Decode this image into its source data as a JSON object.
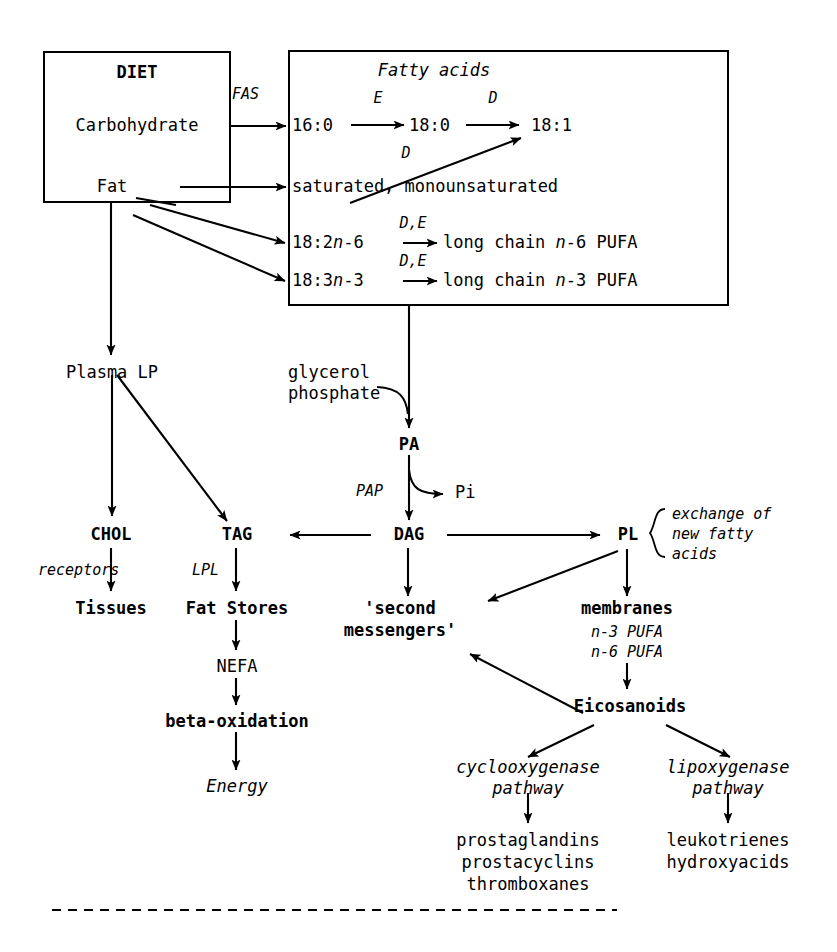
{
  "diagram": {
    "ink_color": "#000000",
    "background_color": "#ffffff",
    "boxes": {
      "diet": {
        "heading": "DIET",
        "items": [
          "Carbohydrate",
          "Fat"
        ]
      },
      "fatty_acids": {
        "heading": "Fatty acids",
        "chain": {
          "a": "16:0",
          "b": "18:0",
          "c": "18:1"
        },
        "saturated_row": "saturated, monounsaturated",
        "n6_precursor": "18:2n-6",
        "n6_product": "long chain n-6 PUFA",
        "n3_precursor": "18:3n-3",
        "n3_product": "long chain n-3 PUFA"
      }
    },
    "enzymes": {
      "fas": "FAS",
      "elongase_e": "E",
      "desaturase_d": "D",
      "desaturase_d2": "D",
      "desat_elong_n6": "D,E",
      "desat_elong_n3": "D,E",
      "pap": "PAP",
      "lpl": "LPL",
      "receptors": "receptors"
    },
    "nodes": {
      "plasma_lp": "Plasma LP",
      "glycerol_phosphate": "glycerol\nphosphate",
      "glycerol_phosphate_line1": "glycerol",
      "glycerol_phosphate_line2": "phosphate",
      "pa": "PA",
      "pi": "Pi",
      "chol": "CHOL",
      "tag": "TAG",
      "dag": "DAG",
      "pl": "PL",
      "exchange_note_line1": "exchange of",
      "exchange_note_line2": "new fatty",
      "exchange_note_line3": "acids",
      "tissues": "Tissues",
      "fat_stores": "Fat Stores",
      "second_messengers_line1": "'second",
      "second_messengers_line2": "messengers'",
      "membranes": "membranes",
      "membranes_n3": "n-3 PUFA",
      "membranes_n6": "n-6 PUFA",
      "nefa": "NEFA",
      "beta_oxidation": "beta-oxidation",
      "energy": "Energy",
      "eicosanoids": "Eicosanoids",
      "cox_line1": "cyclooxygenase",
      "cox_line2": "pathway",
      "lox_line1": "lipoxygenase",
      "lox_line2": "pathway",
      "cox_products": [
        "prostaglandins",
        "prostacyclins",
        "thromboxanes"
      ],
      "lox_products": [
        "leukotrienes",
        "hydroxyacids"
      ]
    }
  }
}
